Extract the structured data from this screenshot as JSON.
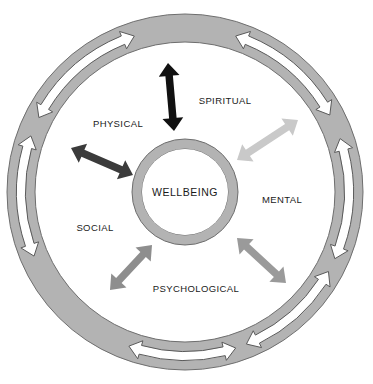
{
  "diagram": {
    "type": "concentric-circle-diagram",
    "colors": {
      "outer_ring_fill": "#b3b3b3",
      "outer_ring_stroke": "#6e6e6e",
      "inner_ring_fill": "#b3b3b3",
      "inner_ring_stroke": "#6e6e6e",
      "center_fill": "#ffffff",
      "background": "#ffffff",
      "outer_arrow_fill": "#ffffff",
      "outer_arrow_stroke": "#5a5a5a",
      "label_text": "#1a1a1a"
    },
    "center": {
      "label": "WELLBEING"
    },
    "dimensions": {
      "outer_radius": 178,
      "ring_thickness": 28,
      "inner_ring_outer_radius": 53,
      "inner_ring_inner_radius": 43,
      "center_x": 185,
      "center_y": 192
    },
    "domain_labels": [
      {
        "id": "physical",
        "label": "PHYSICAL",
        "x": 118,
        "y": 124
      },
      {
        "id": "spiritual",
        "label": "SPIRITUAL",
        "x": 225,
        "y": 101
      },
      {
        "id": "mental",
        "label": "MENTAL",
        "x": 282,
        "y": 200
      },
      {
        "id": "psychological",
        "label": "PSYCHOLOGICAL",
        "x": 196,
        "y": 289
      },
      {
        "id": "social",
        "label": "SOCIAL",
        "x": 95,
        "y": 228
      }
    ],
    "radial_arrows": [
      {
        "id": "arrow-physical-spiritual",
        "color": "#111111",
        "x1": 168,
        "y1": 63,
        "x2": 174,
        "y2": 131,
        "width": 7.5,
        "head": 13
      },
      {
        "id": "arrow-physical-social",
        "color": "#3b3b3b",
        "x1": 71,
        "y1": 148,
        "x2": 133,
        "y2": 175,
        "width": 7.5,
        "head": 13
      },
      {
        "id": "arrow-spiritual-mental",
        "color": "#c9c9c9",
        "x1": 298,
        "y1": 120,
        "x2": 237,
        "y2": 160,
        "width": 7.5,
        "head": 13
      },
      {
        "id": "arrow-mental-psych",
        "color": "#9a9a9a",
        "x1": 286,
        "y1": 283,
        "x2": 237,
        "y2": 238,
        "width": 7.5,
        "head": 13
      },
      {
        "id": "arrow-psych-social",
        "color": "#8e8e8e",
        "x1": 110,
        "y1": 290,
        "x2": 152,
        "y2": 245,
        "width": 7.5,
        "head": 13
      }
    ],
    "ring_arrows": [
      {
        "id": "ring-arrow-top-left",
        "angle_start": 153,
        "angle_end": 108,
        "width": 9,
        "head": 12
      },
      {
        "id": "ring-arrow-top-right",
        "angle_start": 72,
        "angle_end": 28,
        "width": 9,
        "head": 12
      },
      {
        "id": "ring-arrow-right",
        "angle_start": 19,
        "angle_end": -24,
        "width": 9,
        "head": 12
      },
      {
        "id": "ring-arrow-bottom",
        "angle_start": -72,
        "angle_end": -110,
        "width": 9,
        "head": 12
      },
      {
        "id": "ring-arrow-left",
        "angle_start": 203,
        "angle_end": 160,
        "width": 9,
        "head": 12
      },
      {
        "id": "ring-arrow-bottom-right",
        "angle_start": -29,
        "angle_end": -68,
        "width": 9,
        "head": 12
      }
    ]
  }
}
